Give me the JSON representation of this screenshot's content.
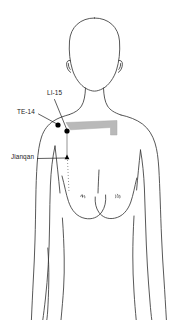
{
  "figure": {
    "background_color": "#ffffff",
    "line_color": "#3a3a3a",
    "marker_color": "#000000",
    "clavicle_shade_color": "#b9b9b9",
    "leader_line_color": "#1a1a1a"
  },
  "labels": {
    "li15": "LI-15",
    "te14": "TE-14",
    "jianqan": "Jianqan"
  },
  "points": [
    {
      "name": "LI-15",
      "marker": "filled-dot",
      "x": 67,
      "y": 131
    },
    {
      "name": "TE-14",
      "marker": "filled-dot",
      "x": 58,
      "y": 125
    },
    {
      "name": "Jianqan",
      "marker": "small-triangle",
      "x": 67,
      "y": 158
    }
  ],
  "anatomy": {
    "parts": [
      "head",
      "left-ear",
      "right-ear",
      "neck",
      "left-shoulder",
      "right-shoulder",
      "left-arm",
      "right-arm",
      "torso",
      "left-breast",
      "right-breast",
      "clavicle-shaded-region",
      "sternum-dotted-line"
    ]
  }
}
